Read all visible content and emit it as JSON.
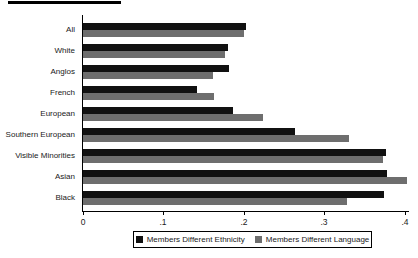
{
  "figure": {
    "background": "#ffffff",
    "bar_color_series1": "#111111",
    "bar_color_series2": "#6e6e6e",
    "axis_color": "#000000"
  },
  "chart_data": {
    "type": "bar",
    "orientation": "horizontal",
    "title": "",
    "xlabel": "",
    "ylabel": "",
    "grid": false,
    "legend_position": "bottom-center",
    "xlim": [
      0,
      0.405
    ],
    "categories": [
      "All",
      "White",
      "Anglos",
      "French",
      "European",
      "Southern European",
      "Visible Minorities",
      "Asian",
      "Black"
    ],
    "series": [
      {
        "name": "Members Different Ethnicity",
        "color": "#111111",
        "values": [
          0.202,
          0.18,
          0.181,
          0.142,
          0.186,
          0.263,
          0.377,
          0.378,
          0.374
        ]
      },
      {
        "name": "Members Different Language",
        "color": "#6e6e6e",
        "values": [
          0.2,
          0.177,
          0.162,
          0.163,
          0.224,
          0.33,
          0.373,
          0.402,
          0.328
        ]
      }
    ],
    "x_ticks": [
      {
        "value": 0.0,
        "label": "0"
      },
      {
        "value": 0.1,
        "label": ".1"
      },
      {
        "value": 0.2,
        "label": ".2"
      },
      {
        "value": 0.3,
        "label": ".3"
      },
      {
        "value": 0.4,
        "label": ".4"
      }
    ]
  }
}
